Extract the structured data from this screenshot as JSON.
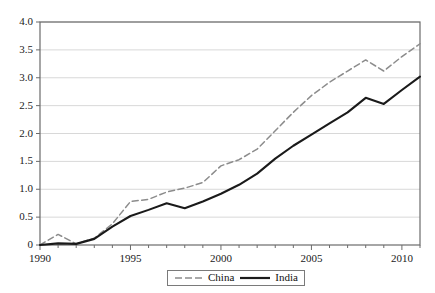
{
  "chart_data": {
    "type": "line",
    "title": "",
    "subtitle": "",
    "xlabel": "",
    "ylabel": "",
    "xlim": [
      1990,
      2011
    ],
    "ylim": [
      0,
      4.0
    ],
    "grid": "horizontal",
    "legend_position": "bottom-center",
    "x": [
      1990,
      1991,
      1992,
      1993,
      1994,
      1995,
      1996,
      1997,
      1998,
      1999,
      2000,
      2001,
      2002,
      2003,
      2004,
      2005,
      2006,
      2007,
      2008,
      2009,
      2010,
      2011
    ],
    "xtick_labels": [
      "1990",
      "1995",
      "2000",
      "2005",
      "2010"
    ],
    "xtick_values": [
      1990,
      1995,
      2000,
      2005,
      2010
    ],
    "ytick_labels": [
      "0",
      "0.5",
      "1.0",
      "1.5",
      "2.0",
      "2.5",
      "3.0",
      "3.5",
      "4.0"
    ],
    "ytick_values": [
      0,
      0.5,
      1.0,
      1.5,
      2.0,
      2.5,
      3.0,
      3.5,
      4.0
    ],
    "series": [
      {
        "name": "China",
        "style": "dashed",
        "color": "#8c8c8c",
        "values": [
          0.0,
          0.19,
          0.02,
          0.12,
          0.38,
          0.78,
          0.82,
          0.95,
          1.02,
          1.12,
          1.42,
          1.53,
          1.72,
          2.05,
          2.38,
          2.68,
          2.92,
          3.12,
          3.32,
          3.12,
          3.38,
          3.61
        ]
      },
      {
        "name": "India",
        "style": "solid",
        "color": "#1a1a1a",
        "values": [
          0.0,
          0.03,
          0.02,
          0.11,
          0.33,
          0.52,
          0.63,
          0.75,
          0.66,
          0.78,
          0.92,
          1.08,
          1.28,
          1.55,
          1.78,
          1.98,
          2.18,
          2.38,
          2.64,
          2.53,
          2.78,
          3.02
        ]
      }
    ]
  },
  "legend": {
    "items": [
      {
        "label": "China",
        "marker": "dashed-line-swatch"
      },
      {
        "label": "India",
        "marker": "solid-line-swatch"
      }
    ]
  },
  "axes": {
    "frame_color": "#6b6b6b",
    "grid_color": "#d8d8d8",
    "tick_color": "#6b6b6b"
  }
}
